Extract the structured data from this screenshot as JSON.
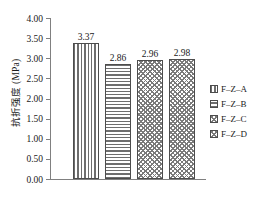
{
  "chart_data": {
    "type": "bar",
    "title": "",
    "xlabel": "",
    "ylabel": "抗折强度 (MPa)",
    "categories": [
      "F–Z–A",
      "F–Z–B",
      "F–Z–C",
      "F–Z–D"
    ],
    "values": [
      3.37,
      2.86,
      2.96,
      2.98
    ],
    "value_labels": [
      "3.37",
      "2.86",
      "2.96",
      "2.98"
    ],
    "ylim": [
      0.0,
      4.0
    ],
    "ytick_labels": [
      "4.00",
      "3.50",
      "3.00",
      "2.50",
      "2.00",
      "1.50",
      "1.00",
      "0.50",
      "0.00"
    ],
    "ytick_values": [
      4.0,
      3.5,
      3.0,
      2.5,
      2.0,
      1.5,
      1.0,
      0.5,
      0.0
    ],
    "grid": false,
    "legend_position": "right",
    "series": [
      {
        "name": "F–Z–A",
        "value": 3.37,
        "pattern": "vertical-lines"
      },
      {
        "name": "F–Z–B",
        "value": 2.86,
        "pattern": "horizontal-lines"
      },
      {
        "name": "F–Z–C",
        "value": 2.96,
        "pattern": "crosshatch"
      },
      {
        "name": "F–Z–D",
        "value": 2.98,
        "pattern": "crosshatch"
      }
    ],
    "colors": {
      "axis": "#808080",
      "bar_edge": "#4d4d4d",
      "bar_hatch": "#6e6e6e",
      "text": "#1a1a1a",
      "background": "#ffffff"
    }
  },
  "legend": {
    "items": [
      {
        "label": "F–Z–A"
      },
      {
        "label": "F–Z–B"
      },
      {
        "label": "F–Z–C"
      },
      {
        "label": "F–Z–D"
      }
    ]
  }
}
